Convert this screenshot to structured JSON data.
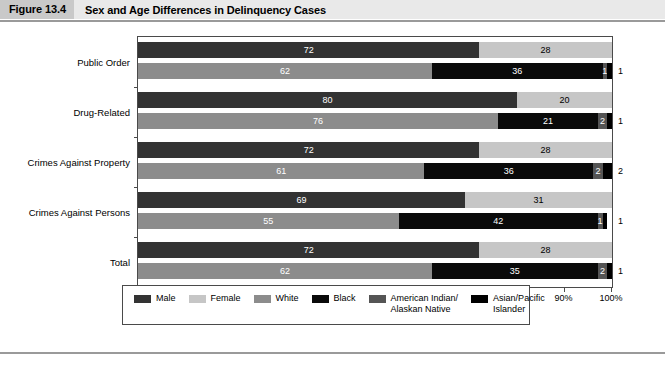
{
  "figure": {
    "tag": "Figure 13.4",
    "title": "Sex and Age Differences in Delinquency Cases"
  },
  "chart_data": {
    "type": "bar",
    "subtype": "stacked-horizontal-100pct",
    "title": "Sex and Age Differences in Delinquency Cases",
    "xlabel": "",
    "ylabel": "",
    "xlim": [
      0,
      100
    ],
    "xticks": [
      "0%",
      "10%",
      "20%",
      "30%",
      "40%",
      "50%",
      "60%",
      "70%",
      "80%",
      "90%",
      "100%"
    ],
    "grid": false,
    "legend_position": "bottom",
    "categories": [
      "Public Order",
      "Drug-Related",
      "Crimes Against Property",
      "Crimes Against Persons",
      "Total"
    ],
    "series": [
      {
        "name": "Male",
        "group": "sex",
        "color": "#333333",
        "values": [
          72,
          80,
          72,
          69,
          72
        ]
      },
      {
        "name": "Female",
        "group": "sex",
        "color": "#c6c6c6",
        "values": [
          28,
          20,
          28,
          31,
          28
        ]
      },
      {
        "name": "White",
        "group": "race",
        "color": "#8c8c8c",
        "values": [
          62,
          76,
          61,
          55,
          62
        ]
      },
      {
        "name": "Black",
        "group": "race",
        "color": "#0a0a0a",
        "values": [
          36,
          21,
          36,
          42,
          35
        ]
      },
      {
        "name": "American Indian/ Alaskan Native",
        "group": "race",
        "color": "#555555",
        "values": [
          1,
          2,
          2,
          1,
          2
        ]
      },
      {
        "name": "Asian/Pacific Islander",
        "group": "race",
        "color": "#000000",
        "values": [
          1,
          1,
          2,
          1,
          1
        ]
      }
    ],
    "groups": [
      {
        "category": "Public Order",
        "sex": [
          {
            "label": "Male",
            "value": 72,
            "text": "72"
          },
          {
            "label": "Female",
            "value": 28,
            "text": "28"
          }
        ],
        "race": [
          {
            "label": "White",
            "value": 62,
            "text": "62"
          },
          {
            "label": "Black",
            "value": 36,
            "text": "36"
          },
          {
            "label": "American Indian/Alaskan Native",
            "value": 1,
            "text": "1"
          },
          {
            "label": "Asian/Pacific Islander",
            "value": 1,
            "text": "1",
            "outside": true
          }
        ]
      },
      {
        "category": "Drug-Related",
        "sex": [
          {
            "label": "Male",
            "value": 80,
            "text": "80"
          },
          {
            "label": "Female",
            "value": 20,
            "text": "20"
          }
        ],
        "race": [
          {
            "label": "White",
            "value": 76,
            "text": "76"
          },
          {
            "label": "Black",
            "value": 21,
            "text": "21"
          },
          {
            "label": "American Indian/Alaskan Native",
            "value": 2,
            "text": "2"
          },
          {
            "label": "Asian/Pacific Islander",
            "value": 1,
            "text": "1",
            "outside": true
          }
        ]
      },
      {
        "category": "Crimes Against Property",
        "sex": [
          {
            "label": "Male",
            "value": 72,
            "text": "72"
          },
          {
            "label": "Female",
            "value": 28,
            "text": "28"
          }
        ],
        "race": [
          {
            "label": "White",
            "value": 61,
            "text": "61"
          },
          {
            "label": "Black",
            "value": 36,
            "text": "36"
          },
          {
            "label": "American Indian/Alaskan Native",
            "value": 2,
            "text": "2"
          },
          {
            "label": "Asian/Pacific Islander",
            "value": 2,
            "text": "2",
            "outside": true
          }
        ]
      },
      {
        "category": "Crimes Against Persons",
        "sex": [
          {
            "label": "Male",
            "value": 69,
            "text": "69"
          },
          {
            "label": "Female",
            "value": 31,
            "text": "31"
          }
        ],
        "race": [
          {
            "label": "White",
            "value": 55,
            "text": "55"
          },
          {
            "label": "Black",
            "value": 42,
            "text": "42"
          },
          {
            "label": "American Indian/Alaskan Native",
            "value": 1,
            "text": "1"
          },
          {
            "label": "Asian/Pacific Islander",
            "value": 1,
            "text": "1",
            "outside": true
          }
        ]
      },
      {
        "category": "Total",
        "sex": [
          {
            "label": "Male",
            "value": 72,
            "text": "72"
          },
          {
            "label": "Female",
            "value": 28,
            "text": "28"
          }
        ],
        "race": [
          {
            "label": "White",
            "value": 62,
            "text": "62"
          },
          {
            "label": "Black",
            "value": 35,
            "text": "35"
          },
          {
            "label": "American Indian/Alaskan Native",
            "value": 2,
            "text": "2"
          },
          {
            "label": "Asian/Pacific Islander",
            "value": 1,
            "text": "1",
            "outside": true
          }
        ]
      }
    ],
    "legend": [
      {
        "label": "Male",
        "color": "#333333"
      },
      {
        "label": "Female",
        "color": "#c6c6c6"
      },
      {
        "label": "White",
        "color": "#8c8c8c"
      },
      {
        "label": "Black",
        "color": "#0a0a0a"
      },
      {
        "label": "American Indian/\nAlaskan Native",
        "color": "#555555"
      },
      {
        "label": "Asian/Pacific\nIslander",
        "color": "#000000"
      }
    ]
  }
}
